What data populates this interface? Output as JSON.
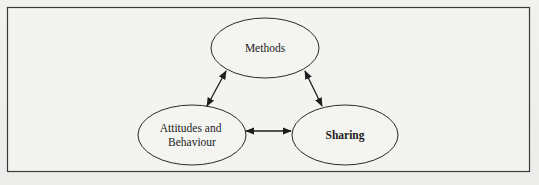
{
  "figure": {
    "type": "cycle-diagram",
    "nodes": [
      {
        "id": "methods",
        "label_lines": [
          "Methods"
        ],
        "bold": false
      },
      {
        "id": "attitudes",
        "label_lines": [
          "Attitudes and",
          "Behaviour"
        ],
        "bold": false
      },
      {
        "id": "sharing",
        "label_lines": [
          "Sharing"
        ],
        "bold": true
      }
    ],
    "edges": [
      {
        "from": "methods",
        "to": "attitudes",
        "direction": "bidirectional"
      },
      {
        "from": "methods",
        "to": "sharing",
        "direction": "bidirectional"
      },
      {
        "from": "attitudes",
        "to": "sharing",
        "direction": "bidirectional"
      }
    ]
  },
  "colors": {
    "stroke": "#2a2a2a",
    "frame": "#3a3a3a",
    "fill": "#f4f4f1"
  }
}
